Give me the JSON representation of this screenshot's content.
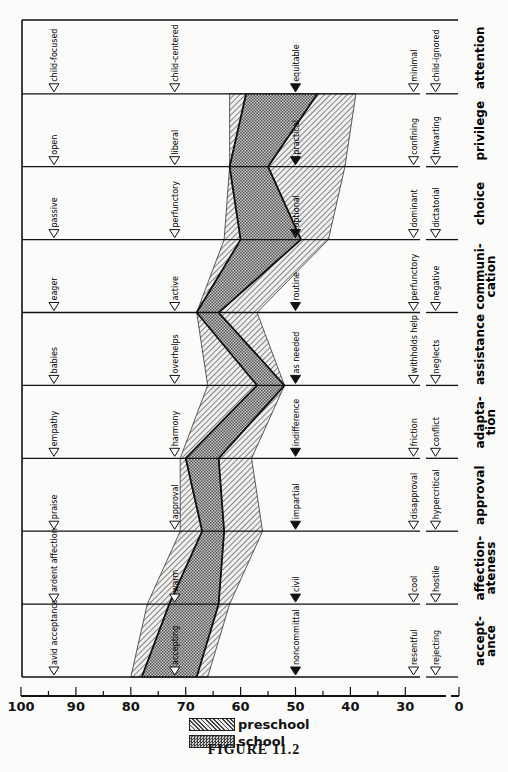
{
  "figure": {
    "caption": "FIGURE 11.2"
  },
  "legend": [
    {
      "name": "preschool",
      "pattern": "diagonal-hatch"
    },
    {
      "name": "school",
      "pattern": "crosshatch"
    }
  ],
  "axis": {
    "ticks": [
      100,
      90,
      80,
      70,
      60,
      50,
      40,
      30,
      0
    ],
    "tick_labels": [
      "100",
      "90",
      "80",
      "70",
      "60",
      "50",
      "40",
      "30",
      "0"
    ]
  },
  "colors": {
    "line": "#111111",
    "preschool_fill": "#d9d9d9",
    "school_fill": "#9a9a9a",
    "background": "#fbfbf9"
  },
  "chart_data": {
    "type": "area",
    "title": "FIGURE 11.2",
    "orientation": "rotated (value axis horizontal, reversed 100 to 0; dimensions stacked vertically)",
    "xlabel": "",
    "ylabel": "",
    "xlim": [
      100,
      0
    ],
    "grid": true,
    "legend_position": "bottom",
    "categories": [
      "acceptance",
      "affectionateness",
      "approval",
      "adaptation",
      "assistance",
      "communication",
      "choice",
      "privilege",
      "attention"
    ],
    "category_labels": [
      "accept-ance",
      "affection-ateness",
      "approval",
      "adapta-tion",
      "assistance",
      "communi-cation",
      "choice",
      "privilege",
      "attention"
    ],
    "anchors": {
      "high_95": [
        "avid acceptance",
        "ardent affection",
        "praise",
        "empathy",
        "babies",
        "eager",
        "passive",
        "open",
        "child-focused"
      ],
      "moderate_72": [
        "accepting",
        "warm",
        "approval",
        "harmony",
        "overhelps",
        "active",
        "perfunctory",
        "liberal",
        "child-centered"
      ],
      "neutral_50": [
        "noncommittal",
        "civil",
        "impartial",
        "indifference",
        "as needed",
        "routine",
        "optional",
        "practical",
        "equitable"
      ],
      "low_28": [
        "resentful",
        "cool",
        "disapproval",
        "friction",
        "withholds help",
        "perfunctory",
        "dominant",
        "confining",
        "minimal"
      ],
      "extreme_low_26": [
        "rejecting",
        "hostile",
        "hypercritical",
        "conflict",
        "neglects",
        "negative",
        "dictatorial",
        "thwarting",
        "child-ignored"
      ]
    },
    "series": [
      {
        "name": "preschool",
        "upper": [
          80,
          77,
          71,
          71,
          66,
          68,
          63,
          62,
          62
        ],
        "lower": [
          66,
          62,
          56,
          58,
          52,
          57,
          44,
          41,
          39
        ]
      },
      {
        "name": "school",
        "upper": [
          78,
          73,
          67,
          70,
          57,
          68,
          60,
          62,
          59
        ],
        "lower": [
          68,
          64,
          63,
          64,
          52,
          64,
          49,
          55,
          46
        ]
      }
    ]
  }
}
